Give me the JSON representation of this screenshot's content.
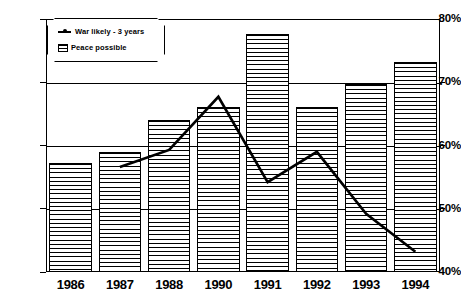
{
  "chart_data": {
    "type": "bar",
    "title": "",
    "xlabel": "",
    "ylabel": "",
    "categories": [
      "1986",
      "1987",
      "1988",
      "1990",
      "1991",
      "1992",
      "1993",
      "1994"
    ],
    "ylim": [
      40,
      80
    ],
    "ytick_labels": [
      "40%",
      "50%",
      "60%",
      "70%",
      "80%"
    ],
    "yticks": [
      40,
      50,
      60,
      70,
      80
    ],
    "grid": true,
    "legend_position": "top-left",
    "series": [
      {
        "name": "Peace possible",
        "type": "bar",
        "values": [
          57.2,
          58.9,
          64.0,
          66.1,
          77.6,
          66.1,
          69.7,
          73.2
        ]
      },
      {
        "name": "War likely - 3 years",
        "type": "line",
        "values": [
          null,
          56.6,
          59.3,
          67.7,
          54.2,
          59.0,
          49.2,
          43.2
        ]
      }
    ]
  },
  "legend": {
    "items": [
      {
        "label": "War likely - 3 years",
        "marker": "line-with-dot"
      },
      {
        "label": "Peace possible",
        "marker": "hatched-swatch"
      }
    ]
  },
  "colors": {
    "foreground": "#000000",
    "background": "#ffffff",
    "bar_fill": "#ffffff",
    "line": "#000000"
  }
}
